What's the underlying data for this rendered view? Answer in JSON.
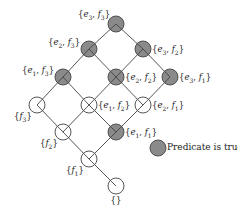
{
  "diagram": {
    "type": "lattice",
    "colors": {
      "true_fill": "#8a8a8a",
      "false_fill": "#ffffff",
      "stroke": "#444444"
    },
    "nodes": [
      {
        "id": "e3f3",
        "label": "{e3, f3}",
        "x": 116,
        "y": 24,
        "true": true,
        "label_side": "left"
      },
      {
        "id": "e2f3",
        "label": "{e2, f3}",
        "x": 89,
        "y": 49,
        "true": true,
        "label_side": "left"
      },
      {
        "id": "e3f2",
        "label": "{e3, f2}",
        "x": 143,
        "y": 49,
        "true": true,
        "label_side": "right"
      },
      {
        "id": "e1f3",
        "label": "{e1, f3}",
        "x": 63,
        "y": 77,
        "true": true,
        "label_side": "left"
      },
      {
        "id": "e2f2",
        "label": "{e2, f2}",
        "x": 116,
        "y": 77,
        "true": true,
        "label_side": "right"
      },
      {
        "id": "e3f1",
        "label": "{e3, f1}",
        "x": 170,
        "y": 77,
        "true": true,
        "label_side": "right"
      },
      {
        "id": "f3",
        "label": "{f3}",
        "x": 37,
        "y": 105,
        "true": false,
        "label_side": "below-left"
      },
      {
        "id": "e1f2",
        "label": "{e1, f2}",
        "x": 89,
        "y": 105,
        "true": false,
        "label_side": "right"
      },
      {
        "id": "e2f1",
        "label": "{e2, f1}",
        "x": 143,
        "y": 105,
        "true": false,
        "label_side": "right"
      },
      {
        "id": "f2",
        "label": "{f2}",
        "x": 63,
        "y": 132,
        "true": false,
        "label_side": "below-left"
      },
      {
        "id": "e1f1",
        "label": "{e1, f1}",
        "x": 116,
        "y": 132,
        "true": true,
        "label_side": "right"
      },
      {
        "id": "f1",
        "label": "{f1}",
        "x": 89,
        "y": 159,
        "true": false,
        "label_side": "below-left"
      },
      {
        "id": "empty",
        "label": "{}",
        "x": 116,
        "y": 186,
        "true": false,
        "label_side": "below"
      }
    ],
    "edges": [
      [
        "e3f3",
        "e2f3"
      ],
      [
        "e3f3",
        "e3f2"
      ],
      [
        "e2f3",
        "e1f3"
      ],
      [
        "e2f3",
        "e2f2"
      ],
      [
        "e3f2",
        "e2f2"
      ],
      [
        "e3f2",
        "e3f1"
      ],
      [
        "e1f3",
        "f3"
      ],
      [
        "e1f3",
        "e1f2"
      ],
      [
        "e2f2",
        "e1f2"
      ],
      [
        "e2f2",
        "e2f1"
      ],
      [
        "e3f1",
        "e2f1"
      ],
      [
        "f3",
        "f2"
      ],
      [
        "e1f2",
        "f2"
      ],
      [
        "e1f2",
        "e1f1"
      ],
      [
        "e2f1",
        "e1f1"
      ],
      [
        "f2",
        "f1"
      ],
      [
        "e1f1",
        "f1"
      ],
      [
        "f1",
        "empty"
      ]
    ],
    "legend": {
      "label": "Predicate is true",
      "x": 158,
      "y": 148
    }
  }
}
